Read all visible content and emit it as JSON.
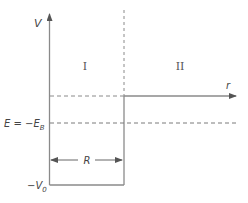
{
  "diagram": {
    "type": "finite-square-well-potential",
    "axes": {
      "vertical_label": "V",
      "horizontal_label": "r"
    },
    "regions": [
      {
        "label": "I"
      },
      {
        "label": "II"
      }
    ],
    "levels": {
      "energy_label_prefix": "E = −E",
      "energy_label_subscript": "B",
      "well_bottom_label_prefix": "−V",
      "well_bottom_label_subscript": "0"
    },
    "width_marker": {
      "label": "R"
    },
    "colors": {
      "line": "#8a8a8a",
      "dash": "#7a7a7a",
      "text": "#444444"
    }
  }
}
